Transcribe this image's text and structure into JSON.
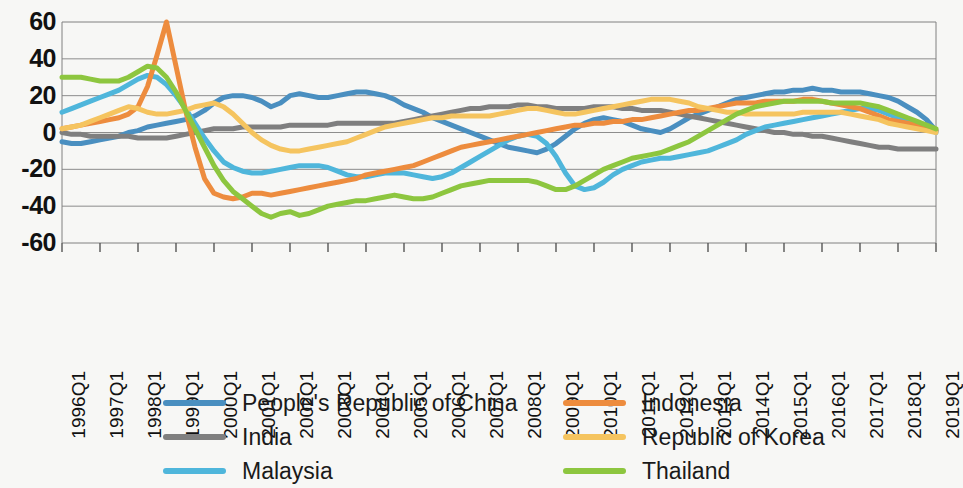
{
  "chart_data": {
    "type": "line",
    "title": "",
    "subtitle": "",
    "xlabel": "",
    "ylabel": "",
    "ylim": [
      -60,
      60
    ],
    "yticks": [
      60,
      40,
      20,
      0,
      -20,
      -40,
      -60
    ],
    "ytick_labels": [
      "60",
      "40",
      "20",
      "0",
      "-20",
      "-40",
      "-60"
    ],
    "grid": true,
    "legend_position": "bottom",
    "legend_columns": 2,
    "x": [
      "1996Q1",
      "1996Q2",
      "1996Q3",
      "1996Q4",
      "1997Q1",
      "1997Q2",
      "1997Q3",
      "1997Q4",
      "1998Q1",
      "1998Q2",
      "1998Q3",
      "1998Q4",
      "1999Q1",
      "1999Q2",
      "1999Q3",
      "1999Q4",
      "2000Q1",
      "2000Q2",
      "2000Q3",
      "2000Q4",
      "2001Q1",
      "2001Q2",
      "2001Q3",
      "2001Q4",
      "2002Q1",
      "2002Q2",
      "2002Q3",
      "2002Q4",
      "2003Q1",
      "2003Q2",
      "2003Q3",
      "2003Q4",
      "2004Q1",
      "2004Q2",
      "2004Q3",
      "2004Q4",
      "2005Q1",
      "2005Q2",
      "2005Q3",
      "2005Q4",
      "2006Q1",
      "2006Q2",
      "2006Q3",
      "2006Q4",
      "2007Q1",
      "2007Q2",
      "2007Q3",
      "2007Q4",
      "2008Q1",
      "2008Q2",
      "2008Q3",
      "2008Q4",
      "2009Q1",
      "2009Q2",
      "2009Q3",
      "2009Q4",
      "2010Q1",
      "2010Q2",
      "2010Q3",
      "2010Q4",
      "2011Q1",
      "2011Q2",
      "2011Q3",
      "2011Q4",
      "2012Q1",
      "2012Q2",
      "2012Q3",
      "2012Q4",
      "2013Q1",
      "2013Q2",
      "2013Q3",
      "2013Q4",
      "2014Q1",
      "2014Q2",
      "2014Q3",
      "2014Q4",
      "2015Q1",
      "2015Q2",
      "2015Q3",
      "2015Q4",
      "2016Q1",
      "2016Q2",
      "2016Q3",
      "2016Q4",
      "2017Q1",
      "2017Q2",
      "2017Q3",
      "2017Q4",
      "2018Q1",
      "2018Q2",
      "2018Q3",
      "2018Q4",
      "2019Q1"
    ],
    "xtick_labels": [
      "1996Q1",
      "1997Q1",
      "1998Q1",
      "1999Q1",
      "2000Q1",
      "2001Q1",
      "2002Q1",
      "2003Q1",
      "2004Q1",
      "2005Q1",
      "2006Q1",
      "2007Q1",
      "2008Q1",
      "2009Q1",
      "2010Q1",
      "2011Q1",
      "2012Q1",
      "2013Q1",
      "2014Q1",
      "2015Q1",
      "2016Q1",
      "2017Q1",
      "2018Q1",
      "2019Q1"
    ],
    "series": [
      {
        "name": "People's Republic of China",
        "color": "#4A8FC0",
        "values": [
          -5,
          -6,
          -6,
          -5,
          -4,
          -3,
          -2,
          0,
          1,
          3,
          4,
          5,
          6,
          7,
          9,
          12,
          16,
          19,
          20,
          20,
          19,
          17,
          14,
          16,
          20,
          21,
          20,
          19,
          19,
          20,
          21,
          22,
          22,
          21,
          20,
          18,
          15,
          13,
          11,
          8,
          6,
          4,
          2,
          0,
          -2,
          -4,
          -6,
          -8,
          -9,
          -10,
          -11,
          -9,
          -6,
          -2,
          2,
          5,
          7,
          8,
          7,
          6,
          4,
          2,
          1,
          0,
          2,
          5,
          8,
          10,
          12,
          14,
          16,
          18,
          19,
          20,
          21,
          22,
          22,
          23,
          23,
          24,
          23,
          23,
          22,
          22,
          22,
          21,
          20,
          19,
          17,
          14,
          11,
          7,
          1
        ]
      },
      {
        "name": "India",
        "color": "#7F7F7F",
        "values": [
          0,
          -1,
          -1,
          -2,
          -2,
          -2,
          -2,
          -2,
          -3,
          -3,
          -3,
          -3,
          -2,
          -1,
          0,
          1,
          2,
          2,
          2,
          3,
          3,
          3,
          3,
          3,
          4,
          4,
          4,
          4,
          4,
          5,
          5,
          5,
          5,
          5,
          5,
          5,
          6,
          7,
          8,
          9,
          10,
          11,
          12,
          13,
          13,
          14,
          14,
          14,
          15,
          15,
          14,
          14,
          13,
          13,
          13,
          13,
          14,
          14,
          14,
          13,
          13,
          12,
          12,
          12,
          11,
          10,
          9,
          8,
          7,
          6,
          5,
          4,
          3,
          2,
          1,
          0,
          0,
          -1,
          -1,
          -2,
          -2,
          -3,
          -4,
          -5,
          -6,
          -7,
          -8,
          -8,
          -9,
          -9,
          -9,
          -9,
          -9
        ]
      },
      {
        "name": "Malaysia",
        "color": "#4FB6DB",
        "values": [
          11,
          13,
          15,
          17,
          19,
          21,
          23,
          26,
          29,
          31,
          30,
          26,
          20,
          13,
          5,
          -3,
          -10,
          -16,
          -19,
          -21,
          -22,
          -22,
          -21,
          -20,
          -19,
          -18,
          -18,
          -18,
          -19,
          -21,
          -23,
          -24,
          -24,
          -23,
          -22,
          -22,
          -22,
          -23,
          -24,
          -25,
          -24,
          -22,
          -19,
          -16,
          -13,
          -10,
          -7,
          -4,
          -2,
          -1,
          -2,
          -6,
          -13,
          -22,
          -29,
          -31,
          -30,
          -27,
          -23,
          -20,
          -18,
          -16,
          -15,
          -14,
          -14,
          -13,
          -12,
          -11,
          -10,
          -8,
          -6,
          -4,
          -1,
          1,
          3,
          4,
          5,
          6,
          7,
          8,
          9,
          10,
          11,
          12,
          13,
          13,
          12,
          10,
          8,
          6,
          4,
          2,
          0
        ]
      },
      {
        "name": "Indonesia",
        "color": "#ED8C3E",
        "values": [
          2,
          3,
          4,
          5,
          6,
          7,
          8,
          10,
          14,
          25,
          42,
          60,
          36,
          12,
          -8,
          -25,
          -33,
          -35,
          -36,
          -35,
          -33,
          -33,
          -34,
          -33,
          -32,
          -31,
          -30,
          -29,
          -28,
          -27,
          -26,
          -25,
          -23,
          -22,
          -21,
          -20,
          -19,
          -18,
          -16,
          -14,
          -12,
          -10,
          -8,
          -7,
          -6,
          -5,
          -4,
          -3,
          -2,
          -1,
          0,
          1,
          2,
          3,
          4,
          4,
          5,
          5,
          6,
          6,
          7,
          7,
          8,
          9,
          10,
          11,
          12,
          12,
          13,
          14,
          15,
          16,
          16,
          16,
          17,
          17,
          17,
          17,
          18,
          18,
          17,
          16,
          15,
          14,
          13,
          11,
          9,
          7,
          6,
          5,
          4,
          3,
          1
        ]
      },
      {
        "name": "Republic of Korea",
        "color": "#F5C45F",
        "values": [
          2,
          3,
          4,
          6,
          8,
          10,
          12,
          14,
          13,
          11,
          10,
          10,
          11,
          12,
          14,
          15,
          16,
          14,
          10,
          5,
          0,
          -4,
          -7,
          -9,
          -10,
          -10,
          -9,
          -8,
          -7,
          -6,
          -5,
          -3,
          -1,
          1,
          3,
          4,
          5,
          6,
          7,
          8,
          8,
          9,
          9,
          9,
          9,
          9,
          10,
          11,
          12,
          13,
          13,
          12,
          11,
          10,
          10,
          11,
          12,
          13,
          14,
          15,
          16,
          17,
          18,
          18,
          18,
          17,
          16,
          14,
          13,
          12,
          11,
          11,
          10,
          10,
          10,
          10,
          10,
          10,
          11,
          11,
          11,
          11,
          11,
          10,
          9,
          8,
          7,
          5,
          4,
          3,
          2,
          1,
          0
        ]
      },
      {
        "name": "Thailand",
        "color": "#8DC63F",
        "values": [
          30,
          30,
          30,
          29,
          28,
          28,
          28,
          30,
          33,
          36,
          35,
          30,
          22,
          12,
          2,
          -8,
          -18,
          -26,
          -32,
          -36,
          -40,
          -44,
          -46,
          -44,
          -43,
          -45,
          -44,
          -42,
          -40,
          -39,
          -38,
          -37,
          -37,
          -36,
          -35,
          -34,
          -35,
          -36,
          -36,
          -35,
          -33,
          -31,
          -29,
          -28,
          -27,
          -26,
          -26,
          -26,
          -26,
          -26,
          -27,
          -29,
          -31,
          -31,
          -29,
          -26,
          -23,
          -20,
          -18,
          -16,
          -14,
          -13,
          -12,
          -11,
          -9,
          -7,
          -5,
          -2,
          1,
          4,
          7,
          10,
          12,
          14,
          15,
          16,
          17,
          17,
          17,
          17,
          17,
          16,
          16,
          16,
          16,
          15,
          14,
          12,
          10,
          8,
          6,
          4,
          2
        ]
      }
    ]
  },
  "legend": {
    "columns": [
      {
        "items": [
          {
            "label": "People's Republic of China",
            "color": "#4A8FC0",
            "icon": "line-swatch-icon"
          },
          {
            "label": "India",
            "color": "#7F7F7F",
            "icon": "line-swatch-icon"
          },
          {
            "label": "Malaysia",
            "color": "#4FB6DB",
            "icon": "line-swatch-icon"
          }
        ]
      },
      {
        "items": [
          {
            "label": "Indonesia",
            "color": "#ED8C3E",
            "icon": "line-swatch-icon"
          },
          {
            "label": "Republic of Korea",
            "color": "#F5C45F",
            "icon": "line-swatch-icon"
          },
          {
            "label": "Thailand",
            "color": "#8DC63F",
            "icon": "line-swatch-icon"
          }
        ]
      }
    ]
  },
  "colors": {
    "background": "#f7f7f5",
    "gridline": "#808080",
    "plot_border": "#808080",
    "text": "#1a1a1a"
  }
}
